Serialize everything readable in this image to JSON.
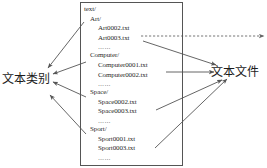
{
  "diagram": {
    "type": "directory-tree-mapping",
    "background_color": "#ffffff",
    "line_color": "#555555",
    "text_color": "#2b2b2b"
  },
  "labels": {
    "category": "文本类别",
    "file": "文本文件"
  },
  "tree": {
    "root": "text/",
    "ellipsis": "……",
    "groups": [
      {
        "folder": "Art/",
        "files": [
          "Art0002.txt",
          "Art0003.txt"
        ],
        "ellipsis": "……"
      },
      {
        "folder": "Computer/",
        "files": [
          "Computer0001.txt",
          "Computer0002.txt"
        ],
        "ellipsis": "……"
      },
      {
        "folder": "Space/",
        "files": [
          "Space0002.txt",
          "Space0003.txt"
        ],
        "ellipsis": "……"
      },
      {
        "folder": "Sport/",
        "files": [
          "Sport0001.txt",
          "Sport0003.txt"
        ],
        "ellipsis": "……"
      }
    ]
  },
  "connectors": {
    "to_category": [
      "arrow-from-art-folder",
      "arrow-from-computer-folder",
      "arrow-from-space-folder",
      "arrow-from-sport-folder"
    ],
    "to_file": [
      "arrow-from-art-file",
      "arrow-from-computer-file",
      "arrow-from-space-file",
      "arrow-from-sport-file"
    ],
    "dashed": [
      "dashed-arrow-right"
    ]
  }
}
